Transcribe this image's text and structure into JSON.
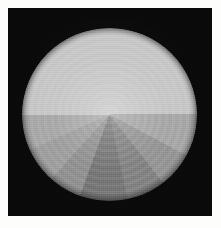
{
  "figure": {
    "type": "radial-sector-grayscale-pattern",
    "caption": "",
    "background_color": "#ffffff",
    "plate": {
      "name": "black-square-plate",
      "color": "#0a0a0a",
      "x": 8,
      "y": 8,
      "width": 204,
      "height": 208
    },
    "disc": {
      "name": "sector-disc",
      "center_x": 110,
      "center_y": 114,
      "radius_x": 87,
      "radius_y": 86,
      "top_half_uniform": true,
      "top_half_color": "#c8c8c8"
    }
  },
  "chart_data": {
    "type": "pie",
    "subtitle": "",
    "xlabel": "",
    "ylabel": "",
    "legend_position": "none",
    "grid": false,
    "units": "degrees",
    "angle_convention": "0 deg at 12 o'clock, increasing clockwise",
    "note": "Upper half is a single uniform bright tone; lower half is split into angular wedges of decreasing luminance toward bottom-centre.",
    "categories": [
      "upper-half",
      "lower-left-outer",
      "lower-left-mid",
      "lower-left-inner",
      "lower-centre",
      "lower-right-inner",
      "lower-right-mid",
      "lower-right-outer"
    ],
    "values": [
      180,
      26,
      22,
      24,
      30,
      24,
      28,
      26
    ],
    "sectors": [
      {
        "label": "upper-half",
        "start_deg": 270,
        "end_deg": 90,
        "gray": 200,
        "color": "#c8c8c8"
      },
      {
        "label": "lower-left-outer",
        "start_deg": 246,
        "end_deg": 270,
        "gray": 170,
        "color": "#aaaaaa"
      },
      {
        "label": "lower-left-mid",
        "start_deg": 222,
        "end_deg": 246,
        "gray": 160,
        "color": "#a0a0a0"
      },
      {
        "label": "lower-left-inner",
        "start_deg": 200,
        "end_deg": 222,
        "gray": 146,
        "color": "#929292"
      },
      {
        "label": "lower-centre",
        "start_deg": 168,
        "end_deg": 200,
        "gray": 120,
        "color": "#787878"
      },
      {
        "label": "lower-right-inner",
        "start_deg": 142,
        "end_deg": 168,
        "gray": 132,
        "color": "#848484"
      },
      {
        "label": "lower-right-mid",
        "start_deg": 118,
        "end_deg": 142,
        "gray": 150,
        "color": "#969696"
      },
      {
        "label": "lower-right-outer",
        "start_deg": 90,
        "end_deg": 118,
        "gray": 168,
        "color": "#a8a8a8"
      }
    ],
    "gray_levels": [
      200,
      170,
      160,
      146,
      120,
      132,
      150,
      168
    ],
    "gray_range": [
      0,
      255
    ]
  }
}
